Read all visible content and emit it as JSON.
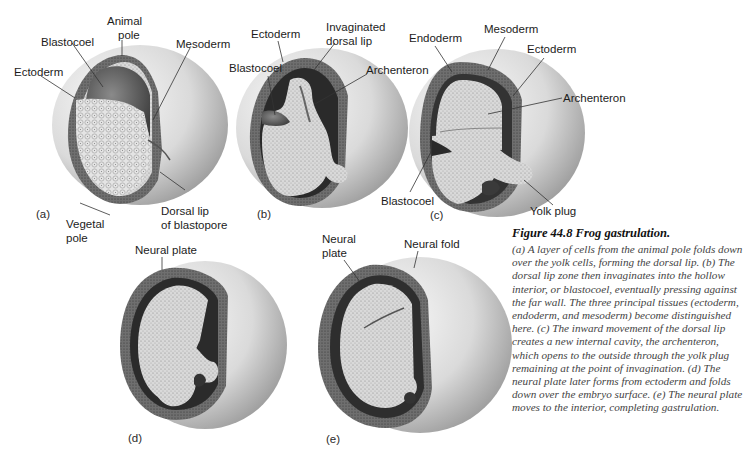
{
  "figure": {
    "number": "Figure 44.8",
    "title": "Figure 44.8 Frog gastrulation.",
    "caption": "(a) A layer of cells from the animal pole folds down over the yolk cells, forming the dorsal lip. (b) The dorsal lip zone then invaginates into the hollow interior, or blastocoel, eventually pressing against the far wall. The three principal tissues (ectoderm, endoderm, and mesoderm) become distinguished here. (c) The inward movement of the dorsal lip creates a new internal cavity, the archenteron, which opens to the outside through the yolk plug remaining at the point of invagination. (d) The neural plate later forms from ectoderm and folds down over the embryo surface. (e) The neural plate moves to the interior, completing gastrulation."
  },
  "panels": {
    "a": {
      "tag": "(a)",
      "labels": {
        "animal_pole": "Animal pole",
        "animal_pole_l1": "Animal",
        "animal_pole_l2": "pole",
        "blastocoel": "Blastocoel",
        "mesoderm": "Mesoderm",
        "ectoderm": "Ectoderm",
        "vegetal_pole_l1": "Vegetal",
        "vegetal_pole_l2": "pole",
        "dorsal_lip_l1": "Dorsal lip",
        "dorsal_lip_l2": "of blastopore"
      }
    },
    "b": {
      "tag": "(b)",
      "labels": {
        "ectoderm": "Ectoderm",
        "invaginated_l1": "Invaginated",
        "invaginated_l2": "dorsal lip",
        "blastocoel": "Blastocoel",
        "archenteron": "Archenteron"
      }
    },
    "c": {
      "tag": "(c)",
      "labels": {
        "endoderm": "Endoderm",
        "mesoderm": "Mesoderm",
        "ectoderm": "Ectoderm",
        "archenteron": "Archenteron",
        "blastocoel": "Blastocoel",
        "yolk_plug": "Yolk plug"
      }
    },
    "d": {
      "tag": "(d)",
      "labels": {
        "neural_plate": "Neural plate"
      }
    },
    "e": {
      "tag": "(e)",
      "labels": {
        "neural_plate_l1": "Neural",
        "neural_plate_l2": "plate",
        "neural_fold": "Neural fold"
      }
    }
  },
  "colors": {
    "background": "#ffffff",
    "shell_light": "#f2f2f2",
    "shell_dark": "#8a8a8a",
    "ectoderm": "#6e6e6e",
    "mesoderm": "#2e2e2e",
    "yolk": "#d8d8d8",
    "cavity": "#5a5a5a",
    "caption_text": "#444444"
  }
}
